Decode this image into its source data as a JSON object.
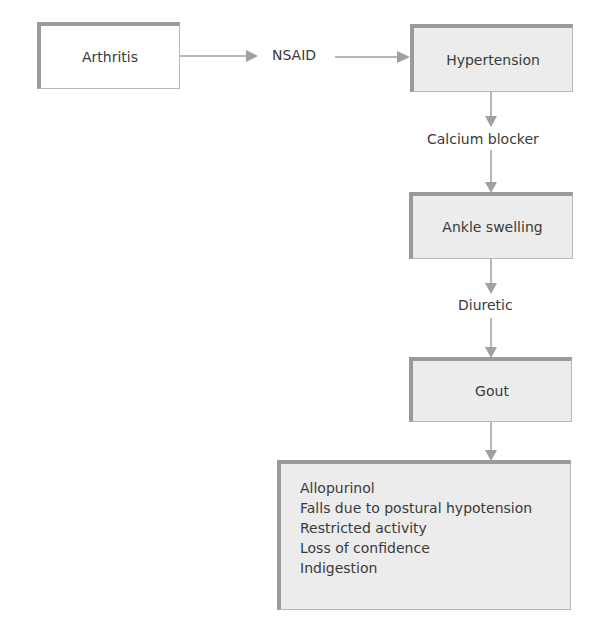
{
  "diagram": {
    "nodes": {
      "arthritis": "Arthritis",
      "hypertension": "Hypertension",
      "ankle_swelling": "Ankle swelling",
      "gout": "Gout"
    },
    "edge_labels": {
      "nsaid": "NSAID",
      "calcium_blocker": "Calcium blocker",
      "diuretic": "Diuretic"
    },
    "outcomes": [
      "Allopurinol",
      "Falls due to postural hypotension",
      "Restricted activity",
      "Loss of confidence",
      "Indigestion"
    ],
    "colors": {
      "box_fill": "#ececec",
      "box_border": "#9a9a9a",
      "arrow": "#9a9a9a",
      "text": "#3a3a3a"
    }
  }
}
